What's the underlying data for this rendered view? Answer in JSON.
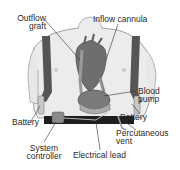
{
  "diagram": {
    "labels": {
      "outflow_graft": [
        "Outflow",
        "graft"
      ],
      "inflow_cannula": "Inflow cannula",
      "blood_pump": [
        "Blood",
        "pump"
      ],
      "battery_left": "Battery",
      "battery_right": "Battery",
      "percutaneous_vent": [
        "Percutaneous",
        "vent"
      ],
      "system_controller": [
        "System",
        "controller"
      ],
      "electrical_lead": "Electrical lead"
    },
    "colors": {
      "skin": "#e4e4e4",
      "outline": "#8a8a8a",
      "strap": "#555555",
      "heart": "#6e6e6e",
      "pump": "#7a7a7a",
      "belt": "#1e1e1e",
      "leader": "#333333"
    }
  }
}
